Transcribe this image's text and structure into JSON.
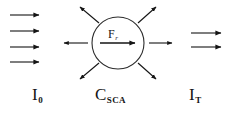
{
  "figure": {
    "width": 233,
    "height": 118,
    "background_color": "#ffffff",
    "stroke_color": "#151515"
  },
  "labels": {
    "incident": {
      "base": "I",
      "sub": "0",
      "name": "incident-intensity-label"
    },
    "scattering": {
      "base": "C",
      "sub": "SCA",
      "name": "scattering-cross-section-label"
    },
    "transmitted": {
      "base": "I",
      "sub": "T",
      "name": "transmitted-intensity-label"
    },
    "force": {
      "base": "F",
      "sub": "r",
      "name": "radiation-force-label"
    }
  },
  "particle": {
    "shape": "circle",
    "center_x": 118,
    "center_y": 43,
    "radius": 26,
    "stroke_color": "#2b2b2b",
    "fill": "none"
  },
  "arrows": {
    "incident_beam": {
      "count": 4,
      "direction": "right",
      "items": [
        {
          "x1": 10,
          "y1": 15,
          "x2": 40,
          "y2": 15
        },
        {
          "x1": 10,
          "y1": 31,
          "x2": 40,
          "y2": 31
        },
        {
          "x1": 10,
          "y1": 47,
          "x2": 40,
          "y2": 47
        },
        {
          "x1": 10,
          "y1": 62,
          "x2": 40,
          "y2": 62
        }
      ]
    },
    "transmitted_beam": {
      "count": 2,
      "direction": "right",
      "items": [
        {
          "x1": 191,
          "y1": 33,
          "x2": 222,
          "y2": 33
        },
        {
          "x1": 191,
          "y1": 47,
          "x2": 222,
          "y2": 47
        }
      ]
    },
    "scattered": {
      "count": 6,
      "direction": "outward",
      "items": [
        {
          "x1": 97,
          "y1": 24,
          "x2": 79,
          "y2": 6,
          "label": "scatter-up-left"
        },
        {
          "x1": 139,
          "y1": 24,
          "x2": 157,
          "y2": 6,
          "label": "scatter-up-right"
        },
        {
          "x1": 88,
          "y1": 43,
          "x2": 63,
          "y2": 43,
          "label": "scatter-left"
        },
        {
          "x1": 148,
          "y1": 43,
          "x2": 173,
          "y2": 43,
          "label": "scatter-right"
        },
        {
          "x1": 97,
          "y1": 62,
          "x2": 79,
          "y2": 79,
          "label": "scatter-down-left"
        },
        {
          "x1": 139,
          "y1": 62,
          "x2": 157,
          "y2": 79,
          "label": "scatter-down-right"
        }
      ]
    },
    "radiation_force": {
      "count": 1,
      "direction": "right",
      "items": [
        {
          "x1": 100,
          "y1": 43,
          "x2": 136,
          "y2": 43
        }
      ]
    }
  }
}
